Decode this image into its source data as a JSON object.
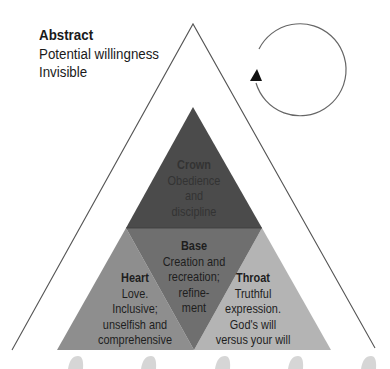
{
  "abstract": {
    "title": "Abstract",
    "line1": "Potential willingness",
    "line2": "Invisible"
  },
  "icons": {
    "cycle": "circular-arrow-icon"
  },
  "sections": {
    "crown": {
      "title": "Crown",
      "body": "Obedience\nand\ndiscipline",
      "color": "#4b4b4b"
    },
    "base": {
      "title": "Base",
      "body": "Creation and\nrecreation;\nrefine-\nment",
      "color": "#6f6f6f"
    },
    "heart": {
      "title": "Heart",
      "body": "Love.\nInclusive;\nunselfish and\ncomprehensive",
      "color": "#8e8e8e"
    },
    "throat": {
      "title": "Throat",
      "body": "Truthful\nexpression.\nGod's will\nversus your will",
      "color": "#b4b4b4"
    }
  },
  "colors": {
    "outline": "#555555",
    "blob": "#d6d6d6"
  }
}
